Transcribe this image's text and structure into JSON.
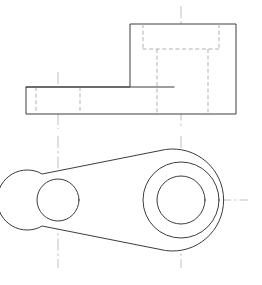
{
  "drawing": {
    "title": "Orthographic engineering drawing of a bracket / connecting-arm part",
    "sheet": {
      "width": 262,
      "height": 285,
      "background_color": "#ffffff"
    },
    "line_styles": {
      "visible_edge_color": "#3c3c3c",
      "hidden_edge_color": "#a8a8a8",
      "center_line_color": "#b9b9b9",
      "face_fill_color": "#ffffff",
      "visible_edge_width": 1,
      "hidden_edge_width": 0.9,
      "center_line_width": 0.9,
      "hidden_dash_pattern": "4 2.6",
      "center_dash_pattern": "12 3 2.5 3"
    },
    "views": [
      {
        "name": "front-elevation-view",
        "label": "Front elevation",
        "projection": "first-angle",
        "bounds": {
          "x": 26,
          "y": 24,
          "width": 210,
          "height": 90
        },
        "outline_points": "26,87 130,87 130,24 236,24 236,114 26,114",
        "boss": {
          "name": "upper-boss-block",
          "x": 130,
          "y": 24,
          "width": 106,
          "height": 63
        },
        "flange": {
          "name": "lower-flange-slab",
          "x": 26,
          "y": 87,
          "width": 210,
          "height": 27
        },
        "internal_visible_lines": [
          {
            "name": "flange-top-edge-under-boss",
            "x1": 26,
            "y1": 87,
            "x2": 174,
            "y2": 87
          }
        ],
        "hidden_lines": [
          {
            "name": "left-hole-hidden-left-wall",
            "x1": 36,
            "y1": 87,
            "x2": 36,
            "y2": 114
          },
          {
            "name": "left-hole-hidden-right-wall",
            "x1": 80,
            "y1": 87,
            "x2": 80,
            "y2": 114
          },
          {
            "name": "counterbore-hidden-left-wall",
            "x1": 143,
            "y1": 24,
            "x2": 143,
            "y2": 49
          },
          {
            "name": "counterbore-hidden-right-wall",
            "x1": 219,
            "y1": 24,
            "x2": 219,
            "y2": 49
          },
          {
            "name": "counterbore-hidden-floor",
            "x1": 143,
            "y1": 49,
            "x2": 219,
            "y2": 49
          },
          {
            "name": "bore-hidden-left-wall",
            "x1": 157,
            "y1": 49,
            "x2": 157,
            "y2": 114
          },
          {
            "name": "bore-hidden-right-wall",
            "x1": 208,
            "y1": 49,
            "x2": 208,
            "y2": 114
          }
        ],
        "center_lines": [
          {
            "name": "left-hole-vertical-centerline",
            "x1": 58,
            "y1": 72,
            "x2": 58,
            "y2": 129
          },
          {
            "name": "large-bore-vertical-centerline",
            "x1": 181,
            "y1": 6,
            "x2": 181,
            "y2": 129
          }
        ]
      },
      {
        "name": "plan-view",
        "label": "Plan (top) view",
        "bounds": {
          "x": 28,
          "y": 142,
          "width": 204,
          "height": 118
        },
        "small_boss": {
          "name": "small-boss",
          "cx": 58,
          "cy": 200,
          "outer_radius": 30,
          "hole_radius": 21
        },
        "large_boss": {
          "name": "large-boss",
          "cx": 181,
          "cy": 200,
          "outer_radius": 51,
          "counterbore_radius": 38,
          "bore_radius": 24
        },
        "web_tangents": [
          {
            "name": "web-upper-tangent",
            "x1": 42,
            "y1": 174,
            "x2": 165,
            "y2": 150
          },
          {
            "name": "web-lower-tangent",
            "x1": 42,
            "y1": 227,
            "x2": 165,
            "y2": 250
          }
        ],
        "center_lines": [
          {
            "name": "plan-horizontal-centerline",
            "x1": 14,
            "y1": 200,
            "x2": 248,
            "y2": 200
          },
          {
            "name": "small-boss-vertical-centerline",
            "x1": 58,
            "y1": 136,
            "x2": 58,
            "y2": 268
          },
          {
            "name": "large-boss-vertical-centerline",
            "x1": 181,
            "y1": 136,
            "x2": 181,
            "y2": 268
          }
        ]
      }
    ]
  }
}
